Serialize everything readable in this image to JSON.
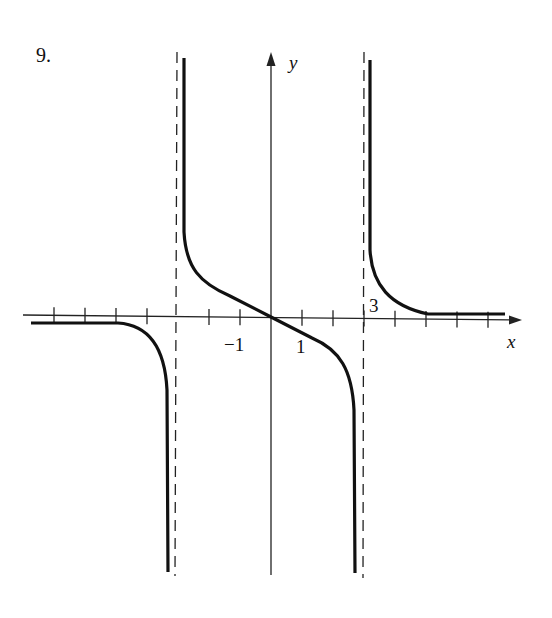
{
  "problem_number": "9.",
  "chart_data": {
    "type": "line",
    "title": "",
    "xlabel": "x",
    "ylabel": "y",
    "tick_labels": [
      {
        "text": "−1",
        "x": -1,
        "position": "below"
      },
      {
        "text": "1",
        "x": 1,
        "position": "below"
      },
      {
        "text": "3",
        "x": 3,
        "position": "above"
      }
    ],
    "x_ticks": [
      -7,
      -6,
      -5,
      -4,
      -2,
      -1,
      1,
      2,
      3,
      4,
      5,
      6,
      7
    ],
    "xlim": [
      -7.8,
      8.0
    ],
    "ylim": [
      -8.2,
      8.5
    ],
    "grid": false,
    "legend": "none",
    "vertical_asymptotes": [
      -3,
      3
    ],
    "horizontal_asymptotes": {
      "left": -0.2,
      "right": 0.1
    },
    "series": [
      {
        "name": "left-branch",
        "points": [
          [
            -7.8,
            -0.25
          ],
          [
            -5,
            -0.22
          ],
          [
            -4.2,
            -0.5
          ],
          [
            -3.7,
            -1.5
          ],
          [
            -3.4,
            -3
          ],
          [
            -3.3,
            -8.1
          ]
        ]
      },
      {
        "name": "middle-branch",
        "points": [
          [
            -2.8,
            8.5
          ],
          [
            -2.8,
            2.7
          ],
          [
            -2.5,
            1
          ],
          [
            -2,
            0.6
          ],
          [
            -1,
            0.3
          ],
          [
            0,
            0
          ],
          [
            1,
            -0.3
          ],
          [
            2,
            -0.6
          ],
          [
            2.5,
            -1
          ],
          [
            2.8,
            -2.7
          ],
          [
            2.8,
            -8.1
          ]
        ]
      },
      {
        "name": "right-branch",
        "points": [
          [
            3.2,
            8.5
          ],
          [
            3.2,
            2.5
          ],
          [
            3.5,
            1
          ],
          [
            4,
            0.4
          ],
          [
            5,
            0.12
          ],
          [
            7.3,
            0.12
          ]
        ]
      }
    ]
  }
}
